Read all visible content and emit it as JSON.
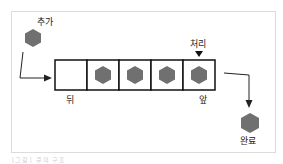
{
  "diagram": {
    "type": "queue",
    "labels": {
      "enqueue": "추가",
      "process": "처리",
      "rear": "뒤",
      "front": "앞",
      "done": "완료"
    },
    "queue_cells": [
      {
        "filled": false
      },
      {
        "filled": true
      },
      {
        "filled": true
      },
      {
        "filled": true
      },
      {
        "filled": true
      }
    ],
    "colors": {
      "hexagon": "#707070",
      "border": "#111111",
      "frame": "#dcdcdc"
    },
    "caption": "[그림] 큐의 구조"
  }
}
